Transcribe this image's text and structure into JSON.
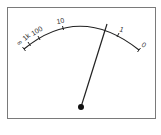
{
  "meter": {
    "type": "ohmmeter",
    "scale_labels": {
      "infinity": "∞",
      "one_k": "1k",
      "hundred": "100",
      "ten": "10",
      "one": "1",
      "zero": "0"
    },
    "colors": {
      "frame": "#7a7a7a",
      "arc": "#222222",
      "needle": "#222222",
      "pivot": "#111111",
      "background": "#ffffff"
    }
  }
}
